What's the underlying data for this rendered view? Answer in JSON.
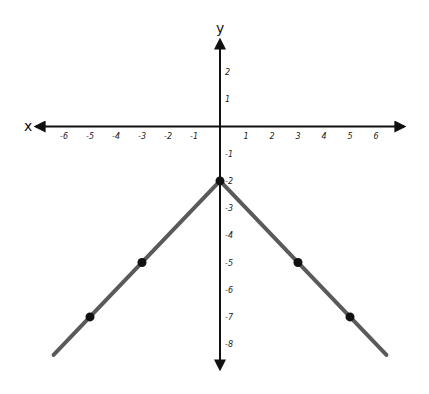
{
  "chart_data": {
    "type": "line",
    "title": "",
    "xlabel": "x",
    "ylabel": "y",
    "xlim": [
      -6.5,
      6.5
    ],
    "ylim": [
      -8.5,
      3
    ],
    "grid": false,
    "legend": null,
    "x_ticks": [
      -6,
      -5,
      -4,
      -3,
      -2,
      -1,
      1,
      2,
      3,
      4,
      5,
      6
    ],
    "y_ticks": [
      2,
      1,
      -1,
      -2,
      -3,
      -4,
      -5,
      -6,
      -7,
      -8
    ],
    "series": [
      {
        "name": "y = -|x| - 2",
        "color": "#5a5a5a",
        "line": [
          [
            -6.4,
            -8.4
          ],
          [
            0,
            -2
          ],
          [
            6.4,
            -8.4
          ]
        ],
        "points": [
          [
            -5,
            -7
          ],
          [
            -3,
            -5
          ],
          [
            0,
            -2
          ],
          [
            3,
            -5
          ],
          [
            5,
            -7
          ]
        ]
      }
    ],
    "point_color": "#111111",
    "axis_color": "#111111"
  }
}
